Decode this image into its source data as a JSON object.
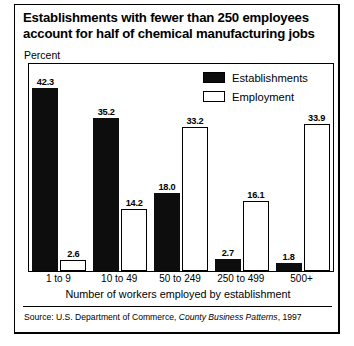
{
  "title": "Establishments with fewer than 250 employees account for half of chemical manufacturing jobs",
  "axis": {
    "y_unit_label": "Percent",
    "x_title": "Number of workers employed by establishment"
  },
  "legend": {
    "items": [
      {
        "label": "Establishments",
        "swatch": "filled-black-square",
        "color": "#0d0d0d"
      },
      {
        "label": "Employment",
        "swatch": "hollow-white-square",
        "color": "#ffffff"
      }
    ]
  },
  "source": {
    "prefix": "Source: U.S. Department of Commerce,",
    "publication": "County Business Patterns",
    "year": ", 1997"
  },
  "chart_data": {
    "type": "bar",
    "title": "Establishments with fewer than 250 employees account for half of chemical manufacturing jobs",
    "xlabel": "Number of workers employed by establishment",
    "ylabel": "Percent",
    "ylim": [
      0,
      45
    ],
    "grid": false,
    "legend_position": "top-right",
    "categories": [
      "1 to 9",
      "10 to 49",
      "50 to 249",
      "250 to 499",
      "500+"
    ],
    "series": [
      {
        "name": "Establishments",
        "color": "#0d0d0d",
        "values": [
          42.3,
          35.2,
          18.0,
          2.7,
          1.8
        ]
      },
      {
        "name": "Employment",
        "color": "#ffffff",
        "values": [
          2.6,
          14.2,
          33.2,
          16.1,
          33.9
        ]
      }
    ]
  }
}
